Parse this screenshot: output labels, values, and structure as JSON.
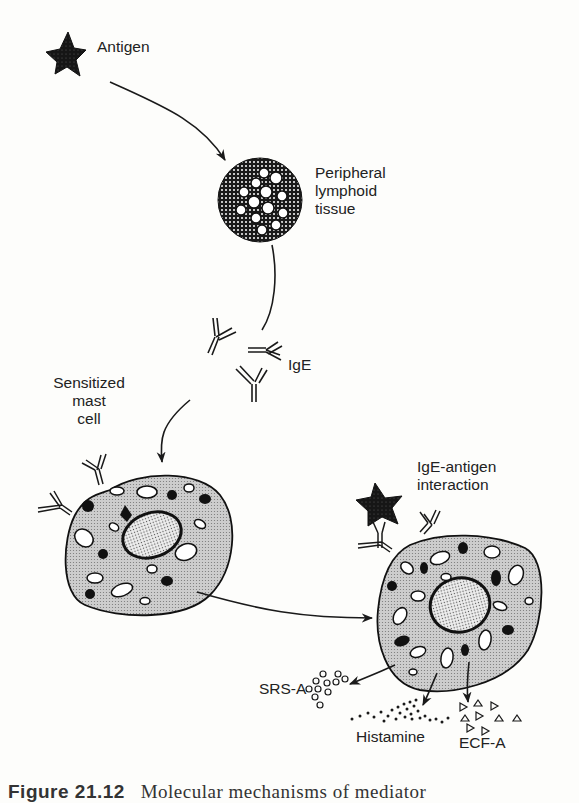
{
  "figure": {
    "labels": {
      "antigen": "Antigen",
      "tissue_line1": "Peripheral",
      "tissue_line2": "lymphoid",
      "tissue_line3": "tissue",
      "ige": "IgE",
      "mast_line1": "Sensitized",
      "mast_line2": "mast",
      "mast_line3": "cell",
      "interaction_line1": "IgE-antigen",
      "interaction_line2": "interaction",
      "srsa": "SRS-A",
      "histamine": "Histamine",
      "ecfa": "ECF-A"
    },
    "caption": {
      "number": "Figure 21.12",
      "text": "Molecular mechanisms of mediator"
    },
    "colors": {
      "ink": "#1a1a1a",
      "cell_fill": "#cfcfcf",
      "nucleus_fill": "#e8e8e8",
      "background": "#fdfdfb"
    }
  }
}
